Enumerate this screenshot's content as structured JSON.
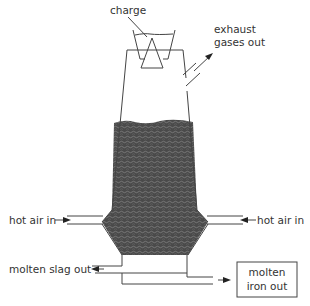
{
  "diagram": {
    "labels": {
      "charge": "charge",
      "exhaust_line1": "exhaust",
      "exhaust_line2": "gases out",
      "hot_air_left": "hot air in",
      "hot_air_right": "hot air in",
      "slag_out": "molten slag out",
      "iron_line1": "molten",
      "iron_line2": "iron out"
    },
    "colors": {
      "line": "#444444",
      "charge_fill": "#4a4a4a",
      "text": "#333333"
    }
  }
}
